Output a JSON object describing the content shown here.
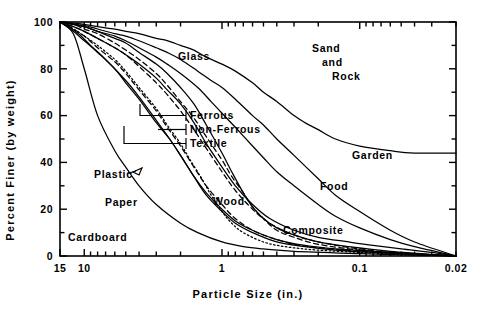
{
  "chart_data": {
    "type": "line",
    "title": "",
    "xlabel": "Particle Size (in.)",
    "ylabel": "Percent Finer (by weight)",
    "xscale": "log-reversed",
    "xlim": [
      15,
      0.02
    ],
    "ylim": [
      0,
      100
    ],
    "grid": false,
    "legend": "inline-labels",
    "x_tick_labels": [
      "15",
      "10",
      "1",
      "0.1",
      "0.02"
    ],
    "x_tick_values": [
      15,
      10,
      1,
      0.1,
      0.02
    ],
    "y_tick_labels": [
      "0",
      "20",
      "40",
      "60",
      "80",
      "100"
    ],
    "y_tick_values": [
      0,
      20,
      40,
      60,
      80,
      100
    ],
    "y_minor_ticks": [
      10,
      30,
      50,
      70,
      90
    ],
    "series": [
      {
        "name": "Cardboard",
        "style": "solid",
        "label_x": 0.72,
        "points": [
          [
            15,
            100
          ],
          [
            12,
            95
          ],
          [
            10,
            80
          ],
          [
            8,
            60
          ],
          [
            6,
            45
          ],
          [
            5,
            38
          ],
          [
            4,
            30
          ],
          [
            3,
            22
          ],
          [
            2,
            14
          ],
          [
            1.5,
            10
          ],
          [
            1,
            6
          ],
          [
            0.7,
            4
          ],
          [
            0.5,
            3
          ],
          [
            0.3,
            2
          ],
          [
            0.1,
            1
          ],
          [
            0.05,
            0.5
          ],
          [
            0.02,
            0
          ]
        ]
      },
      {
        "name": "Paper",
        "style": "solid",
        "label_x": 0.62,
        "points": [
          [
            15,
            100
          ],
          [
            13,
            98
          ],
          [
            11,
            95
          ],
          [
            9,
            90
          ],
          [
            7,
            84
          ],
          [
            5,
            75
          ],
          [
            4,
            68
          ],
          [
            3,
            58
          ],
          [
            2.4,
            50
          ],
          [
            2,
            43
          ],
          [
            1.6,
            34
          ],
          [
            1.3,
            27
          ],
          [
            1,
            20
          ],
          [
            0.8,
            15
          ],
          [
            0.6,
            11
          ],
          [
            0.4,
            7
          ],
          [
            0.25,
            4.5
          ],
          [
            0.15,
            3
          ],
          [
            0.08,
            2
          ],
          [
            0.04,
            1
          ],
          [
            0.02,
            0
          ]
        ]
      },
      {
        "name": "Plastic",
        "style": "solid",
        "label_x": 0.56,
        "points": [
          [
            15,
            100
          ],
          [
            12,
            96
          ],
          [
            10,
            92
          ],
          [
            8,
            87
          ],
          [
            6,
            80
          ],
          [
            5,
            74
          ],
          [
            4,
            67
          ],
          [
            3,
            57
          ],
          [
            2.4,
            50
          ],
          [
            2,
            43
          ],
          [
            1.6,
            34
          ],
          [
            1.3,
            26
          ],
          [
            1,
            19
          ],
          [
            0.8,
            14
          ],
          [
            0.6,
            10
          ],
          [
            0.4,
            6
          ],
          [
            0.25,
            4
          ],
          [
            0.15,
            2.5
          ],
          [
            0.08,
            1.5
          ],
          [
            0.04,
            0.8
          ],
          [
            0.02,
            0
          ]
        ]
      },
      {
        "name": "Textile",
        "style": "dotted",
        "points": [
          [
            15,
            100
          ],
          [
            12,
            97
          ],
          [
            10,
            94
          ],
          [
            8,
            90
          ],
          [
            6,
            84
          ],
          [
            5,
            79
          ],
          [
            4,
            72
          ],
          [
            3,
            63
          ],
          [
            2.5,
            56
          ],
          [
            2,
            48
          ],
          [
            1.7,
            41
          ],
          [
            1.4,
            33
          ],
          [
            1.2,
            26
          ],
          [
            1,
            19
          ],
          [
            0.85,
            14
          ],
          [
            0.7,
            10
          ],
          [
            0.5,
            6
          ],
          [
            0.35,
            4
          ],
          [
            0.2,
            2.5
          ],
          [
            0.1,
            1.5
          ],
          [
            0.05,
            0.7
          ],
          [
            0.02,
            0
          ]
        ]
      },
      {
        "name": "Non-Ferrous",
        "style": "dashed",
        "points": [
          [
            15,
            100
          ],
          [
            12,
            97
          ],
          [
            10,
            94
          ],
          [
            8,
            89
          ],
          [
            6,
            83
          ],
          [
            5,
            78
          ],
          [
            4,
            71
          ],
          [
            3,
            62
          ],
          [
            2.5,
            55
          ],
          [
            2,
            47
          ],
          [
            1.6,
            38
          ],
          [
            1.3,
            30
          ],
          [
            1,
            22
          ],
          [
            0.8,
            16
          ],
          [
            0.6,
            11
          ],
          [
            0.45,
            8
          ],
          [
            0.3,
            5
          ],
          [
            0.2,
            3.5
          ],
          [
            0.1,
            2
          ],
          [
            0.05,
            1
          ],
          [
            0.02,
            0
          ]
        ]
      },
      {
        "name": "Ferrous",
        "style": "dashed",
        "points": [
          [
            15,
            100
          ],
          [
            12,
            98
          ],
          [
            10,
            96
          ],
          [
            8,
            93
          ],
          [
            6,
            89
          ],
          [
            5,
            86
          ],
          [
            4,
            81
          ],
          [
            3,
            74
          ],
          [
            2.5,
            69
          ],
          [
            2,
            62
          ],
          [
            1.6,
            54
          ],
          [
            1.3,
            46
          ],
          [
            1,
            36
          ],
          [
            0.8,
            28
          ],
          [
            0.6,
            20
          ],
          [
            0.45,
            14
          ],
          [
            0.3,
            9
          ],
          [
            0.2,
            6
          ],
          [
            0.1,
            3
          ],
          [
            0.05,
            1.2
          ],
          [
            0.02,
            0
          ]
        ]
      },
      {
        "name": "Wood",
        "style": "solid",
        "label_x": 0.38,
        "points": [
          [
            15,
            100
          ],
          [
            12,
            99
          ],
          [
            10,
            98
          ],
          [
            8,
            96
          ],
          [
            6,
            93
          ],
          [
            5,
            91
          ],
          [
            4,
            87
          ],
          [
            3,
            82
          ],
          [
            2.5,
            78
          ],
          [
            2,
            72
          ],
          [
            1.6,
            65
          ],
          [
            1.3,
            56
          ],
          [
            1,
            44
          ],
          [
            0.85,
            36
          ],
          [
            0.7,
            27
          ],
          [
            0.6,
            21
          ],
          [
            0.5,
            16
          ],
          [
            0.4,
            12
          ],
          [
            0.3,
            9
          ],
          [
            0.2,
            6
          ],
          [
            0.12,
            4
          ],
          [
            0.06,
            2
          ],
          [
            0.02,
            0
          ]
        ]
      },
      {
        "name": "Glass",
        "style": "dashed",
        "label_x": 0.3,
        "points": [
          [
            15,
            100
          ],
          [
            12,
            99
          ],
          [
            10,
            97
          ],
          [
            8,
            95
          ],
          [
            6,
            91
          ],
          [
            5,
            88
          ],
          [
            4,
            84
          ],
          [
            3,
            78
          ],
          [
            2.5,
            73
          ],
          [
            2,
            66
          ],
          [
            1.6,
            59
          ],
          [
            1.3,
            51
          ],
          [
            1,
            41
          ],
          [
            0.85,
            34
          ],
          [
            0.7,
            27
          ],
          [
            0.6,
            21
          ],
          [
            0.5,
            16
          ],
          [
            0.4,
            11
          ],
          [
            0.3,
            8
          ],
          [
            0.2,
            5
          ],
          [
            0.1,
            2.5
          ],
          [
            0.05,
            1
          ],
          [
            0.02,
            0
          ]
        ]
      },
      {
        "name": "Composite",
        "style": "solid",
        "label_x": 0.16,
        "points": [
          [
            15,
            100
          ],
          [
            12,
            98
          ],
          [
            10,
            96
          ],
          [
            8,
            93
          ],
          [
            6,
            89
          ],
          [
            5,
            86
          ],
          [
            4,
            82
          ],
          [
            3,
            76
          ],
          [
            2.5,
            71
          ],
          [
            2,
            65
          ],
          [
            1.6,
            57
          ],
          [
            1.3,
            48
          ],
          [
            1,
            38
          ],
          [
            0.8,
            30
          ],
          [
            0.6,
            22
          ],
          [
            0.45,
            16
          ],
          [
            0.3,
            11
          ],
          [
            0.2,
            8
          ],
          [
            0.12,
            6
          ],
          [
            0.08,
            4.5
          ],
          [
            0.05,
            3
          ],
          [
            0.03,
            1.5
          ],
          [
            0.02,
            0
          ]
        ]
      },
      {
        "name": "Food",
        "style": "solid",
        "label_x": 0.155,
        "points": [
          [
            15,
            100
          ],
          [
            12,
            99
          ],
          [
            10,
            98
          ],
          [
            8,
            96
          ],
          [
            6,
            94
          ],
          [
            5,
            92
          ],
          [
            4,
            89
          ],
          [
            3,
            85
          ],
          [
            2.5,
            82
          ],
          [
            2,
            78
          ],
          [
            1.5,
            72
          ],
          [
            1.2,
            66
          ],
          [
            1,
            61
          ],
          [
            0.8,
            55
          ],
          [
            0.6,
            47
          ],
          [
            0.5,
            42
          ],
          [
            0.4,
            36
          ],
          [
            0.3,
            30
          ],
          [
            0.2,
            22
          ],
          [
            0.15,
            17
          ],
          [
            0.1,
            12
          ],
          [
            0.06,
            7
          ],
          [
            0.04,
            4
          ],
          [
            0.02,
            0
          ]
        ]
      },
      {
        "name": "Garden",
        "style": "solid",
        "label_x": 0.19,
        "points": [
          [
            15,
            100
          ],
          [
            12,
            99
          ],
          [
            10,
            98.5
          ],
          [
            8,
            97
          ],
          [
            6,
            95
          ],
          [
            5,
            94
          ],
          [
            4,
            92
          ],
          [
            3,
            89
          ],
          [
            2.5,
            87
          ],
          [
            2,
            84
          ],
          [
            1.5,
            79
          ],
          [
            1.2,
            75
          ],
          [
            1,
            72
          ],
          [
            0.8,
            67
          ],
          [
            0.6,
            60
          ],
          [
            0.5,
            56
          ],
          [
            0.4,
            50
          ],
          [
            0.3,
            43
          ],
          [
            0.2,
            33
          ],
          [
            0.15,
            26
          ],
          [
            0.1,
            19
          ],
          [
            0.06,
            11
          ],
          [
            0.04,
            6
          ],
          [
            0.02,
            0
          ]
        ]
      },
      {
        "name": "Sand and Rock",
        "style": "solid",
        "label_x": 1.1,
        "points": [
          [
            15,
            100
          ],
          [
            12,
            99.5
          ],
          [
            10,
            99
          ],
          [
            8,
            98
          ],
          [
            6,
            97
          ],
          [
            5,
            96
          ],
          [
            4,
            95
          ],
          [
            3,
            93
          ],
          [
            2.5,
            92
          ],
          [
            2,
            90
          ],
          [
            1.6,
            88
          ],
          [
            1.3,
            85
          ],
          [
            1,
            82
          ],
          [
            0.8,
            79
          ],
          [
            0.6,
            74
          ],
          [
            0.5,
            70
          ],
          [
            0.4,
            66
          ],
          [
            0.3,
            60
          ],
          [
            0.25,
            57
          ],
          [
            0.2,
            54
          ],
          [
            0.15,
            50
          ],
          [
            0.1,
            47
          ],
          [
            0.06,
            45
          ],
          [
            0.04,
            44
          ],
          [
            0.02,
            44
          ]
        ]
      }
    ],
    "annotations": [
      {
        "label": "Ferrous",
        "x": 0.62,
        "y": 57
      },
      {
        "label": "Non-Ferrous",
        "x": 0.62,
        "y": 51
      },
      {
        "label": "Textile",
        "x": 0.62,
        "y": 45
      }
    ]
  },
  "labels": {
    "glass": "Glass",
    "sand": "Sand",
    "and": "and",
    "rock": "Rock",
    "garden": "Garden",
    "food": "Food",
    "composite": "Composite",
    "wood": "Wood",
    "plastic": "Plastic",
    "paper": "Paper",
    "cardboard": "Cardboard",
    "ferrous": "Ferrous",
    "non_ferrous": "Non-Ferrous",
    "textile": "Textile"
  },
  "axes": {
    "x_title": "Particle Size (in.)",
    "y_title": "Percent Finer (by weight)",
    "x_labels": [
      "15",
      "10",
      "1",
      "0.1",
      "0.02"
    ],
    "y_labels": [
      "0",
      "20",
      "40",
      "60",
      "80",
      "100"
    ]
  }
}
